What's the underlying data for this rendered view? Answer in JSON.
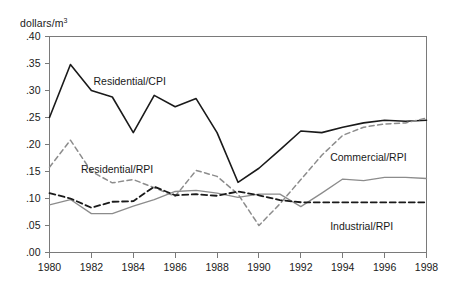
{
  "chart_data": {
    "type": "line",
    "title": "",
    "subtitle": "",
    "xlabel": "",
    "ylabel": "dollars/m",
    "ylabel_sup": "3",
    "xlim": [
      1980,
      1998
    ],
    "ylim": [
      0.0,
      0.4
    ],
    "grid": false,
    "legend_position": "inline-annotations",
    "x": [
      1980,
      1981,
      1982,
      1983,
      1984,
      1985,
      1986,
      1987,
      1988,
      1989,
      1990,
      1991,
      1992,
      1993,
      1994,
      1995,
      1996,
      1997,
      1998
    ],
    "ytick_labels": [
      ".40",
      ".35",
      ".30",
      ".25",
      ".20",
      ".15",
      ".10",
      ".05",
      ".00"
    ],
    "ytick_values": [
      0.4,
      0.35,
      0.3,
      0.25,
      0.2,
      0.15,
      0.1,
      0.05,
      0.0
    ],
    "xtick_labels": [
      "1980",
      "1982",
      "1984",
      "1986",
      "1988",
      "1990",
      "1992",
      "1994",
      "1996",
      "1998"
    ],
    "xtick_values": [
      1980,
      1982,
      1984,
      1986,
      1988,
      1990,
      1992,
      1994,
      1996,
      1998
    ],
    "series": [
      {
        "name": "Residential/CPI",
        "style": "solid",
        "color": "#1a1a1a",
        "width": 1.6,
        "label_x": 1982.1,
        "label_y": 0.317,
        "values": [
          0.25,
          0.348,
          0.3,
          0.288,
          0.222,
          0.291,
          0.27,
          0.285,
          0.222,
          0.13,
          0.156,
          0.19,
          0.225,
          0.222,
          0.232,
          0.24,
          0.245,
          0.243,
          0.245
        ]
      },
      {
        "name": "Residential/RPI",
        "style": "dashed",
        "color": "#8c8c8c",
        "width": 1.5,
        "label_x": 1981.5,
        "label_y": 0.154,
        "values": [
          0.158,
          0.208,
          0.15,
          0.129,
          0.135,
          0.12,
          0.104,
          0.152,
          0.141,
          0.108,
          0.05,
          0.09,
          0.135,
          0.18,
          0.217,
          0.232,
          0.238,
          0.24,
          0.249
        ]
      },
      {
        "name": "Commercial/RPI",
        "style": "solid",
        "color": "#8c8c8c",
        "width": 1.3,
        "label_x": 1993.4,
        "label_y": 0.176,
        "values": [
          0.088,
          0.098,
          0.072,
          0.072,
          0.086,
          0.098,
          0.113,
          0.115,
          0.11,
          0.102,
          0.108,
          0.108,
          0.085,
          0.11,
          0.136,
          0.133,
          0.139,
          0.139,
          0.137
        ]
      },
      {
        "name": "Industrial/RPI",
        "style": "dashed",
        "color": "#1a1a1a",
        "width": 1.8,
        "label_x": 1993.4,
        "label_y": 0.048,
        "values": [
          0.11,
          0.1,
          0.083,
          0.094,
          0.095,
          0.122,
          0.106,
          0.108,
          0.105,
          0.113,
          0.106,
          0.097,
          0.093,
          0.093,
          0.093,
          0.093,
          0.093,
          0.093,
          0.093
        ]
      }
    ]
  },
  "axes": {
    "unit_label": "dollars/m"
  }
}
